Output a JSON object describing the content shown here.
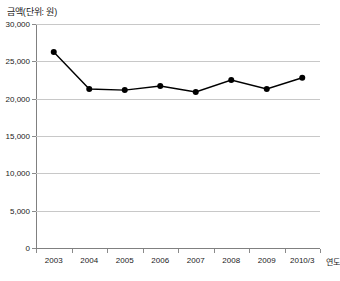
{
  "chart_data": {
    "type": "line",
    "title": "",
    "ylabel": "금액(단위: 원)",
    "xlabel": "연도",
    "categories": [
      "2003",
      "2004",
      "2005",
      "2006",
      "2007",
      "2008",
      "2009",
      "2010/3"
    ],
    "values": [
      26250,
      21300,
      21150,
      21700,
      20900,
      22500,
      21300,
      22800
    ],
    "series": [
      {
        "name": "금액",
        "values": [
          26250,
          21300,
          21150,
          21700,
          20900,
          22500,
          21300,
          22800
        ]
      }
    ],
    "ylim": [
      0,
      30000
    ],
    "ytick_values": [
      0,
      5000,
      10000,
      15000,
      20000,
      25000,
      30000
    ],
    "ytick_labels": [
      "0",
      "5,000",
      "10,000",
      "15,000",
      "20,000",
      "25,000",
      "30,000"
    ],
    "grid": true,
    "legend": false,
    "legend_position": "none",
    "marker": "circle",
    "line_color": "#000000",
    "marker_color": "#000000",
    "grid_color": "#c8c8c8"
  },
  "axes": {
    "y_caption": "금액(단위: 원)",
    "x_caption": "연도"
  }
}
